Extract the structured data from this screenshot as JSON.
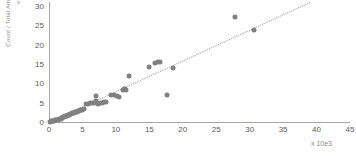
{
  "chart_data": {
    "type": "scatter",
    "title": "",
    "xlabel": "x 10e3",
    "ylabel": "Count / Total Amount",
    "y_exponent_marker": "x",
    "xlim": [
      0,
      45
    ],
    "ylim": [
      0,
      31
    ],
    "xticks": [
      0,
      5,
      10,
      15,
      20,
      25,
      30,
      35,
      40,
      45
    ],
    "yticks": [
      0,
      5,
      10,
      15,
      20,
      25,
      30
    ],
    "grid": false,
    "legend": "none",
    "marker_color": "#808080",
    "trendline": {
      "style": "dotted",
      "color": "#9a9a9a",
      "x0": 0.0,
      "y0": 0.0,
      "x1": 39.0,
      "y1": 31.0
    },
    "points": [
      {
        "x": 0.15,
        "y": 0.1
      },
      {
        "x": 0.3,
        "y": 0.15
      },
      {
        "x": 0.45,
        "y": 0.2
      },
      {
        "x": 0.6,
        "y": 0.25
      },
      {
        "x": 0.75,
        "y": 0.3
      },
      {
        "x": 0.9,
        "y": 0.4
      },
      {
        "x": 1.0,
        "y": 0.45
      },
      {
        "x": 1.15,
        "y": 0.5
      },
      {
        "x": 1.3,
        "y": 0.6
      },
      {
        "x": 1.45,
        "y": 0.7
      },
      {
        "x": 1.6,
        "y": 0.8
      },
      {
        "x": 1.75,
        "y": 0.9
      },
      {
        "x": 1.9,
        "y": 1.0
      },
      {
        "x": 2.0,
        "y": 1.1
      },
      {
        "x": 2.15,
        "y": 1.2
      },
      {
        "x": 2.3,
        "y": 1.3
      },
      {
        "x": 2.45,
        "y": 1.45
      },
      {
        "x": 2.6,
        "y": 1.5
      },
      {
        "x": 2.75,
        "y": 1.6
      },
      {
        "x": 2.9,
        "y": 1.7
      },
      {
        "x": 3.0,
        "y": 1.8
      },
      {
        "x": 3.15,
        "y": 2.0
      },
      {
        "x": 3.3,
        "y": 2.1
      },
      {
        "x": 3.45,
        "y": 2.2
      },
      {
        "x": 3.6,
        "y": 2.3
      },
      {
        "x": 3.75,
        "y": 2.4
      },
      {
        "x": 3.9,
        "y": 2.6
      },
      {
        "x": 4.05,
        "y": 2.5
      },
      {
        "x": 4.2,
        "y": 2.7
      },
      {
        "x": 4.35,
        "y": 2.8
      },
      {
        "x": 4.5,
        "y": 2.9
      },
      {
        "x": 4.65,
        "y": 3.0
      },
      {
        "x": 4.8,
        "y": 3.1
      },
      {
        "x": 5.0,
        "y": 3.2
      },
      {
        "x": 5.3,
        "y": 3.4
      },
      {
        "x": 5.6,
        "y": 4.6
      },
      {
        "x": 5.9,
        "y": 4.7
      },
      {
        "x": 6.2,
        "y": 4.8
      },
      {
        "x": 6.5,
        "y": 4.9
      },
      {
        "x": 6.8,
        "y": 5.0
      },
      {
        "x": 7.0,
        "y": 6.6
      },
      {
        "x": 7.1,
        "y": 5.4
      },
      {
        "x": 7.3,
        "y": 4.6
      },
      {
        "x": 7.6,
        "y": 4.8
      },
      {
        "x": 7.9,
        "y": 5.0
      },
      {
        "x": 8.2,
        "y": 5.1
      },
      {
        "x": 8.5,
        "y": 5.2
      },
      {
        "x": 9.3,
        "y": 7.0
      },
      {
        "x": 9.7,
        "y": 7.1
      },
      {
        "x": 10.1,
        "y": 6.6
      },
      {
        "x": 10.4,
        "y": 6.5
      },
      {
        "x": 11.0,
        "y": 8.2
      },
      {
        "x": 11.2,
        "y": 8.4
      },
      {
        "x": 11.4,
        "y": 8.6
      },
      {
        "x": 11.5,
        "y": 8.3
      },
      {
        "x": 11.9,
        "y": 11.8
      },
      {
        "x": 14.9,
        "y": 14.3
      },
      {
        "x": 15.9,
        "y": 15.3
      },
      {
        "x": 16.3,
        "y": 15.6
      },
      {
        "x": 16.6,
        "y": 15.6
      },
      {
        "x": 17.6,
        "y": 7.0
      },
      {
        "x": 18.6,
        "y": 13.9
      },
      {
        "x": 27.8,
        "y": 27.1
      },
      {
        "x": 30.6,
        "y": 23.8
      }
    ]
  }
}
